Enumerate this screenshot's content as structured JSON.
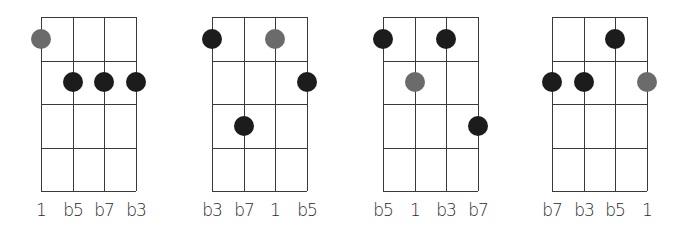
{
  "colors": {
    "grid": "#3a3a3a",
    "root_dot": "#6b6b6b",
    "note_dot": "#1c1c1c",
    "label": "#2a2a2a",
    "background": "#ffffff"
  },
  "diagrams": [
    {
      "strings": 4,
      "frets": 4,
      "labels": [
        "1",
        "b5",
        "b7",
        "b3"
      ],
      "dots": [
        {
          "string": 1,
          "fret": 1,
          "type": "root"
        },
        {
          "string": 2,
          "fret": 2,
          "type": "note"
        },
        {
          "string": 3,
          "fret": 2,
          "type": "note"
        },
        {
          "string": 4,
          "fret": 2,
          "type": "note"
        }
      ]
    },
    {
      "strings": 4,
      "frets": 4,
      "labels": [
        "b3",
        "b7",
        "1",
        "b5"
      ],
      "dots": [
        {
          "string": 1,
          "fret": 1,
          "type": "note"
        },
        {
          "string": 3,
          "fret": 1,
          "type": "root"
        },
        {
          "string": 4,
          "fret": 2,
          "type": "note"
        },
        {
          "string": 2,
          "fret": 3,
          "type": "note"
        }
      ]
    },
    {
      "strings": 4,
      "frets": 4,
      "labels": [
        "b5",
        "1",
        "b3",
        "b7"
      ],
      "dots": [
        {
          "string": 1,
          "fret": 1,
          "type": "note"
        },
        {
          "string": 3,
          "fret": 1,
          "type": "note"
        },
        {
          "string": 2,
          "fret": 2,
          "type": "root"
        },
        {
          "string": 4,
          "fret": 3,
          "type": "note"
        }
      ]
    },
    {
      "strings": 4,
      "frets": 4,
      "labels": [
        "b7",
        "b3",
        "b5",
        "1"
      ],
      "dots": [
        {
          "string": 3,
          "fret": 1,
          "type": "note"
        },
        {
          "string": 1,
          "fret": 2,
          "type": "note"
        },
        {
          "string": 2,
          "fret": 2,
          "type": "note"
        },
        {
          "string": 4,
          "fret": 2,
          "type": "root"
        }
      ]
    }
  ]
}
